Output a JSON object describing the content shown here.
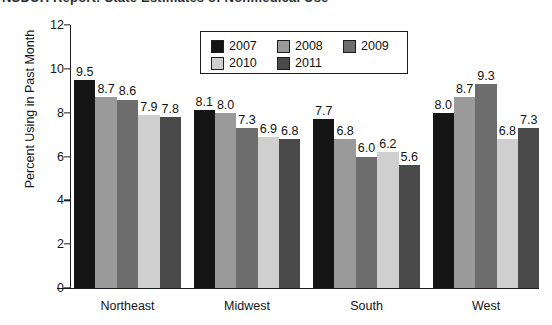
{
  "title_sliver": {
    "text": "NSDUH Report: State Estimates of Nonmedical Use"
  },
  "chart_data": {
    "type": "bar",
    "title": "",
    "xlabel": "",
    "ylabel": "Percent Using in Past Month",
    "ylim": [
      0,
      12
    ],
    "yticks": [
      "0",
      "2",
      "4",
      "6",
      "8",
      "10",
      "12"
    ],
    "grid": false,
    "legend_position": "top-center",
    "categories": [
      "Northeast",
      "Midwest",
      "South",
      "West"
    ],
    "series": [
      {
        "name": "2007",
        "color": "#151515",
        "values": [
          9.5,
          8.1,
          7.7,
          8.0
        ]
      },
      {
        "name": "2008",
        "color": "#9a9a9a",
        "values": [
          8.7,
          8.0,
          6.8,
          8.7
        ]
      },
      {
        "name": "2009",
        "color": "#6d6d6d",
        "values": [
          8.6,
          7.3,
          6.0,
          9.3
        ]
      },
      {
        "name": "2010",
        "color": "#cfcfcf",
        "values": [
          7.9,
          6.9,
          6.2,
          6.8
        ]
      },
      {
        "name": "2011",
        "color": "#4a4a4a",
        "values": [
          7.8,
          6.8,
          5.6,
          7.3
        ]
      }
    ],
    "value_labels": [
      [
        "9.5",
        "8.7",
        "8.6",
        "7.9",
        "7.8"
      ],
      [
        "8.1",
        "8.0",
        "7.3",
        "6.9",
        "6.8"
      ],
      [
        "7.7",
        "6.8",
        "6.0",
        "6.2",
        "5.6"
      ],
      [
        "8.0",
        "8.7",
        "9.3",
        "6.8",
        "7.3"
      ]
    ]
  },
  "legend": {
    "entries": [
      {
        "label": "2007",
        "color": "#151515"
      },
      {
        "label": "2008",
        "color": "#9a9a9a"
      },
      {
        "label": "2009",
        "color": "#6d6d6d"
      },
      {
        "label": "2010",
        "color": "#cfcfcf"
      },
      {
        "label": "2011",
        "color": "#4a4a4a"
      }
    ]
  },
  "axis": {
    "y_title": "Percent Using in Past Month"
  }
}
